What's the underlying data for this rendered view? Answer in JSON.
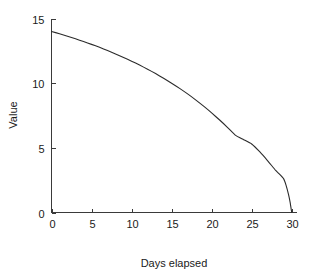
{
  "chart_data": {
    "type": "line",
    "title": "",
    "subtitle": "",
    "xlabel": "Days elapsed",
    "ylabel": "Value",
    "xlim": [
      0,
      30.6
    ],
    "ylim": [
      0,
      15
    ],
    "xticks": [
      0,
      5,
      10,
      15,
      20,
      25,
      30
    ],
    "xtick_labels": [
      "0",
      "5",
      "10",
      "15",
      "20",
      "25",
      "30"
    ],
    "yticks": [
      0,
      5,
      10,
      15
    ],
    "ytick_labels": [
      "0",
      "5",
      "10",
      "15"
    ],
    "grid": false,
    "legend": false,
    "legend_position": "none",
    "spines": [
      "left",
      "bottom"
    ],
    "tick_direction": "in",
    "line_color": "#2b2b2b",
    "background_color": "#ffffff",
    "series": [
      {
        "name": "Value",
        "marker": "none",
        "x": [
          0,
          1,
          2,
          3,
          4,
          5,
          6,
          7,
          8,
          9,
          10,
          11,
          12,
          13,
          14,
          15,
          16,
          17,
          18,
          19,
          20,
          21,
          22,
          23,
          24,
          25,
          26,
          27,
          28,
          28.5,
          29,
          29.3,
          29.6,
          29.8,
          30
        ],
        "y": [
          14.0,
          13.82,
          13.63,
          13.43,
          13.22,
          13.0,
          12.77,
          12.52,
          12.26,
          11.99,
          11.7,
          11.4,
          11.08,
          10.74,
          10.38,
          10.0,
          9.6,
          9.17,
          8.71,
          8.22,
          7.7,
          7.15,
          6.57,
          5.96,
          5.63,
          5.3,
          4.7,
          4.0,
          3.25,
          2.95,
          2.6,
          2.1,
          1.4,
          0.8,
          0.0
        ]
      }
    ]
  },
  "axes": {
    "x_title": "Days elapsed",
    "y_title": "Value"
  }
}
